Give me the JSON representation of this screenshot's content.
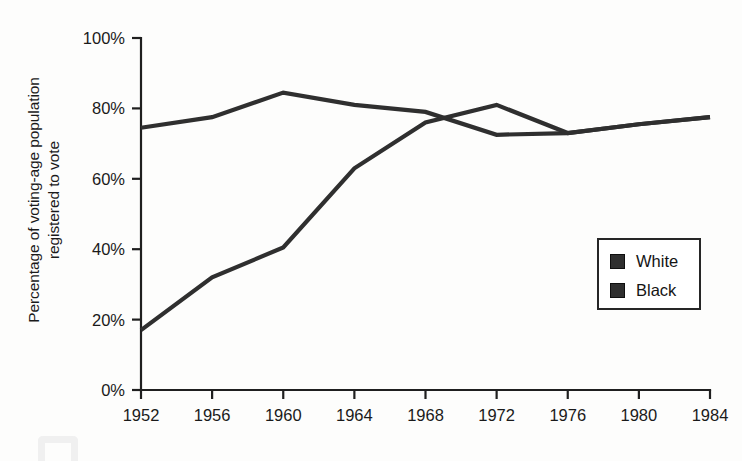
{
  "chart_data": {
    "type": "line",
    "title": "",
    "xlabel": "",
    "ylabel": "Percentage of voting-age population registered to vote",
    "ylabel_line1": "Percentage of voting-age population",
    "ylabel_line2": "registered to vote",
    "x": [
      1952,
      1956,
      1960,
      1964,
      1968,
      1972,
      1976,
      1980,
      1984
    ],
    "categories": [
      "1952",
      "1956",
      "1960",
      "1964",
      "1968",
      "1972",
      "1976",
      "1980",
      "1984"
    ],
    "series": [
      {
        "name": "White",
        "color": "#2f2f2f",
        "values": [
          74.5,
          77.5,
          84.5,
          81.0,
          79.0,
          72.5,
          73.0,
          75.5,
          77.5
        ]
      },
      {
        "name": "Black",
        "color": "#2f2f2f",
        "values": [
          17.0,
          32.0,
          40.5,
          63.0,
          76.0,
          81.0,
          73.0,
          75.5,
          77.5
        ]
      }
    ],
    "ylim": [
      0,
      100
    ],
    "xlim": [
      1952,
      1984
    ],
    "yticks": [
      0,
      20,
      40,
      60,
      80,
      100
    ],
    "ytick_labels": [
      "0%",
      "20%",
      "40%",
      "60%",
      "80%",
      "100%"
    ],
    "grid": false,
    "legend_position": "center-right",
    "legend_entries": [
      "White",
      "Black"
    ]
  },
  "legend": {
    "items": [
      {
        "label": "White"
      },
      {
        "label": "Black"
      }
    ]
  }
}
